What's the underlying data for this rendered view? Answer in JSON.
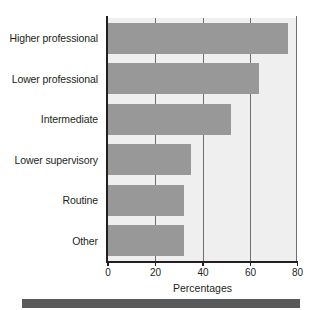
{
  "chart_data": {
    "type": "bar",
    "orientation": "horizontal",
    "title": "",
    "subtitle": "",
    "xlabel": "Percentages",
    "ylabel": "",
    "categories": [
      "Higher professional",
      "Lower professional",
      "Intermediate",
      "Lower supervisory",
      "Routine",
      "Other"
    ],
    "values": [
      76,
      64,
      52,
      35,
      32,
      32
    ],
    "series": [
      {
        "name": "Percentages",
        "values": [
          76,
          64,
          52,
          35,
          32,
          32
        ]
      }
    ],
    "xlim": [
      0,
      80
    ],
    "xticks": [
      0,
      20,
      40,
      60,
      80
    ],
    "xtick_labels": [
      "0",
      "20",
      "40",
      "60",
      "80"
    ],
    "grid": true,
    "grid_axis": "x",
    "legend": false,
    "legend_position": "none",
    "annotations": []
  },
  "style": {
    "bar_color": "#989898",
    "plot_background": "#efefef",
    "page_background": "#ffffff",
    "axis_color": "#231f20",
    "gridline_color": "#6d6e71",
    "text_color": "#231f20",
    "banner_color": "#58595b"
  },
  "axis": {
    "x_title": "Percentages",
    "tick_labels": [
      "0",
      "20",
      "40",
      "60",
      "80"
    ]
  },
  "footer": {
    "banner_label": ""
  }
}
